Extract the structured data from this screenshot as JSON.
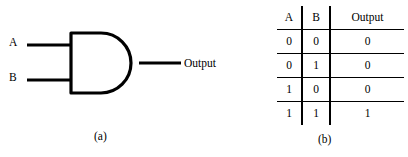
{
  "figure": {
    "background_color": "#ffffff",
    "line_color": "#000000"
  },
  "gate_diagram": {
    "gate_type": "AND",
    "inputs": [
      {
        "label": "A"
      },
      {
        "label": "B"
      }
    ],
    "output": {
      "label": "Output"
    },
    "caption": "(a)"
  },
  "truth_table": {
    "caption": "(b)",
    "columns": [
      "A",
      "B",
      "Output"
    ],
    "rows": [
      [
        "0",
        "0",
        "0"
      ],
      [
        "0",
        "1",
        "0"
      ],
      [
        "1",
        "0",
        "0"
      ],
      [
        "1",
        "1",
        "1"
      ]
    ]
  }
}
